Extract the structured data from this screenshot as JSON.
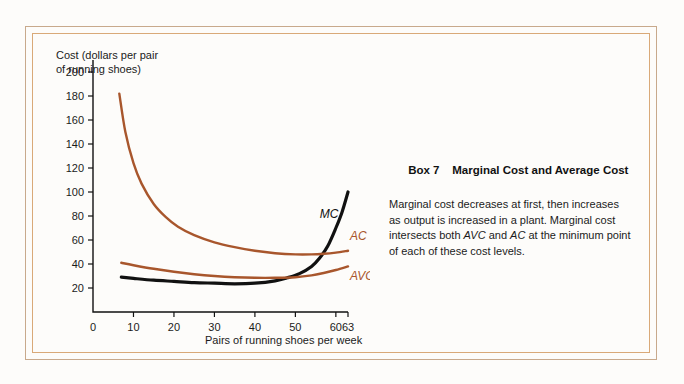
{
  "figure": {
    "y_axis_label": "Cost (dollars per pair\nof running shoes)",
    "x_axis_label": "Pairs of running shoes per week"
  },
  "panel": {
    "box_number": "Box 7",
    "title": "Marginal Cost and Average Cost",
    "body_part1": "Marginal cost decreases at first, then increases as output is increased in a plant. Marginal cost intersects both ",
    "body_em1": "AVC",
    "body_part2": " and ",
    "body_em2": "AC",
    "body_part3": " at the minimum point of each of these cost levels."
  },
  "colors": {
    "curve_mc": "#111111",
    "curve_brown": "#a8562c",
    "frame_outer": "#c8a98c",
    "frame_inner": "#d9a978",
    "background": "#fdfcfa",
    "text": "#1b1b1b"
  },
  "chart_data": {
    "type": "line",
    "title": "",
    "xlabel": "Pairs of running shoes per week",
    "ylabel": "Cost (dollars per pair of running shoes)",
    "xlim": [
      0,
      63
    ],
    "ylim": [
      0,
      210
    ],
    "grid": false,
    "legend": "inline-curve-labels",
    "xticks": [
      0,
      10,
      20,
      30,
      40,
      50,
      60,
      63
    ],
    "yticks": [
      20,
      40,
      60,
      80,
      100,
      120,
      140,
      160,
      180,
      200
    ],
    "series": [
      {
        "name": "MC",
        "label": "MC",
        "color": "#111111",
        "points": [
          [
            7,
            29
          ],
          [
            10,
            28
          ],
          [
            15,
            26.5
          ],
          [
            20,
            25.5
          ],
          [
            25,
            24.5
          ],
          [
            30,
            24
          ],
          [
            35,
            23.5
          ],
          [
            40,
            24
          ],
          [
            45,
            26
          ],
          [
            48,
            28.5
          ],
          [
            51,
            32
          ],
          [
            54,
            38
          ],
          [
            56,
            45
          ],
          [
            58,
            55
          ],
          [
            60,
            70
          ],
          [
            61.5,
            83
          ],
          [
            63,
            100
          ]
        ]
      },
      {
        "name": "AC",
        "label": "AC",
        "color": "#a8562c",
        "points": [
          [
            6.5,
            182
          ],
          [
            8,
            150
          ],
          [
            10,
            124
          ],
          [
            12,
            107
          ],
          [
            15,
            90
          ],
          [
            18,
            79
          ],
          [
            21,
            71
          ],
          [
            25,
            64
          ],
          [
            30,
            58
          ],
          [
            35,
            54
          ],
          [
            40,
            51
          ],
          [
            45,
            49
          ],
          [
            50,
            48
          ],
          [
            54,
            48
          ],
          [
            57,
            48.5
          ],
          [
            60,
            49.5
          ],
          [
            63,
            51
          ]
        ]
      },
      {
        "name": "AVC",
        "label": "AVC",
        "color": "#a8562c",
        "points": [
          [
            7,
            41
          ],
          [
            10,
            39
          ],
          [
            15,
            36
          ],
          [
            20,
            33.5
          ],
          [
            25,
            31.5
          ],
          [
            30,
            30
          ],
          [
            35,
            29
          ],
          [
            40,
            28.5
          ],
          [
            45,
            28.5
          ],
          [
            50,
            29
          ],
          [
            54,
            30.5
          ],
          [
            57,
            32.5
          ],
          [
            60,
            35
          ],
          [
            63,
            38
          ]
        ]
      }
    ],
    "annotations": [
      {
        "text": "MC",
        "x": 56,
        "y": 78
      },
      {
        "text": "AC",
        "x": 63.5,
        "y": 60
      },
      {
        "text": "AVC",
        "x": 63.5,
        "y": 27
      }
    ]
  }
}
